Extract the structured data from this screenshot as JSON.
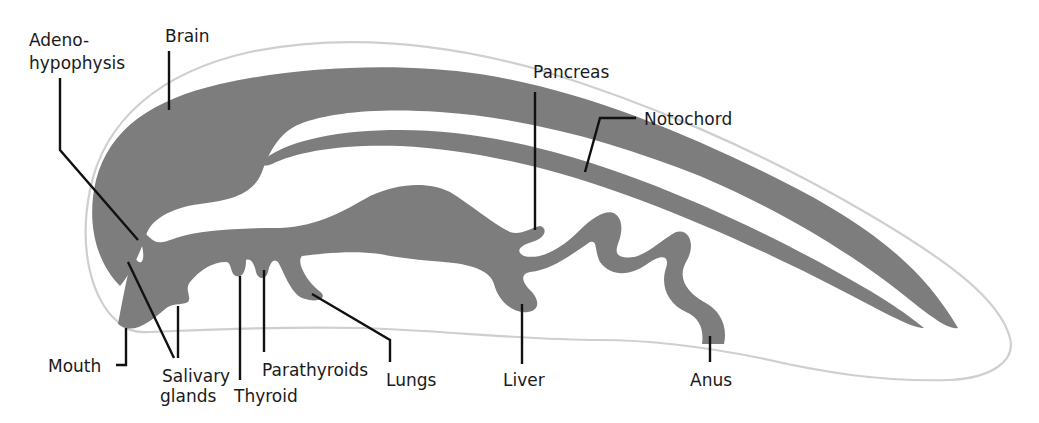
{
  "diagram": {
    "colors": {
      "organ_fill": "#7d7d7d",
      "body_outline": "#cfcfcf",
      "leader_line": "#111111",
      "text": "#1a1a1a",
      "background": "#ffffff"
    },
    "labels": {
      "adenohypophysis_line1": "Adeno-",
      "adenohypophysis_line2": "hypophysis",
      "brain": "Brain",
      "pancreas": "Pancreas",
      "notochord": "Notochord",
      "mouth": "Mouth",
      "salivary_line1": "Salivary",
      "salivary_line2": "glands",
      "thyroid": "Thyroid",
      "parathyroids": "Parathyroids",
      "lungs": "Lungs",
      "liver": "Liver",
      "anus": "Anus"
    }
  }
}
